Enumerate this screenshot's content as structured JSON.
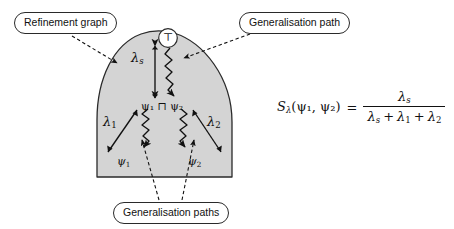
{
  "figure": {
    "background_color": "#ffffff",
    "shape_fill_color": "#d4d4d4",
    "shape_stroke_color": "#2a2a2a",
    "line_color": "#111111",
    "width": 454,
    "height": 229
  },
  "callouts": [
    {
      "id": "refinement-graph",
      "label": "Refinement graph",
      "points_to": "refinement-graph-boundary"
    },
    {
      "id": "generalisation-path",
      "label": "Generalisation path",
      "points_to": "top-squiggly-path"
    },
    {
      "id": "generalisation-paths",
      "label": "Generalisation paths",
      "points_to": "lower-squiggly-paths"
    }
  ],
  "diagram": {
    "top_node": {
      "symbol": "⊤",
      "name": "top-element"
    },
    "labels": {
      "lambda_s": {
        "base": "λ",
        "sub": "s"
      },
      "lambda_1": {
        "base": "λ",
        "sub": "1"
      },
      "lambda_2": {
        "base": "λ",
        "sub": "2"
      },
      "psi_meet": {
        "text": "ψ₁ ⊓ ψ₂"
      },
      "psi_1": {
        "base": "ψ",
        "sub": "1"
      },
      "psi_2": {
        "base": "ψ",
        "sub": "2"
      }
    }
  },
  "formula": {
    "lhs": {
      "function": "S",
      "function_sub": "λ",
      "args": "(ψ₁, ψ₂)"
    },
    "equals": "=",
    "numerator": {
      "base": "λ",
      "sub": "s"
    },
    "denominator": {
      "terms": [
        {
          "base": "λ",
          "sub": "s"
        },
        {
          "base": "λ",
          "sub": "1"
        },
        {
          "base": "λ",
          "sub": "2"
        }
      ],
      "operator": "+"
    },
    "plain_text": "S_λ(ψ₁, ψ₂) = λ_s / (λ_s + λ₁ + λ₂)"
  }
}
